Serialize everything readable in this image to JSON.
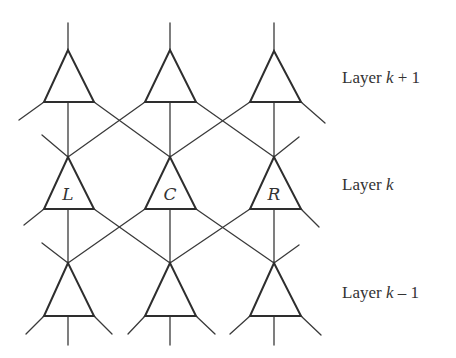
{
  "diagram": {
    "type": "layered-network",
    "columns_x": [
      68,
      170,
      274
    ],
    "layers": [
      {
        "id": "top",
        "prefix": "Layer ",
        "var": "k",
        "suffix": " + 1",
        "apex_y": 50,
        "base_y": 102,
        "label_y": 68
      },
      {
        "id": "middle",
        "prefix": "Layer ",
        "var": "k",
        "suffix": "",
        "apex_y": 157,
        "base_y": 209,
        "label_y": 175
      },
      {
        "id": "bottom",
        "prefix": "Layer ",
        "var": "k",
        "suffix": " – 1",
        "apex_y": 263,
        "base_y": 316,
        "label_y": 283
      }
    ],
    "middle_node_labels": [
      "L",
      "C",
      "R"
    ],
    "line_color": "#3a3a3a"
  }
}
